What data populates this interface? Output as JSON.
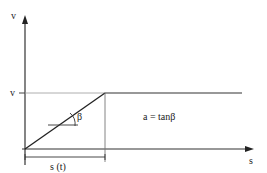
{
  "diagram": {
    "axes": {
      "y_label": "v",
      "x_label": "s"
    },
    "level_label": "v",
    "angle_label": "β",
    "equation": "a = tanβ",
    "dimension_label": "s (t)"
  }
}
